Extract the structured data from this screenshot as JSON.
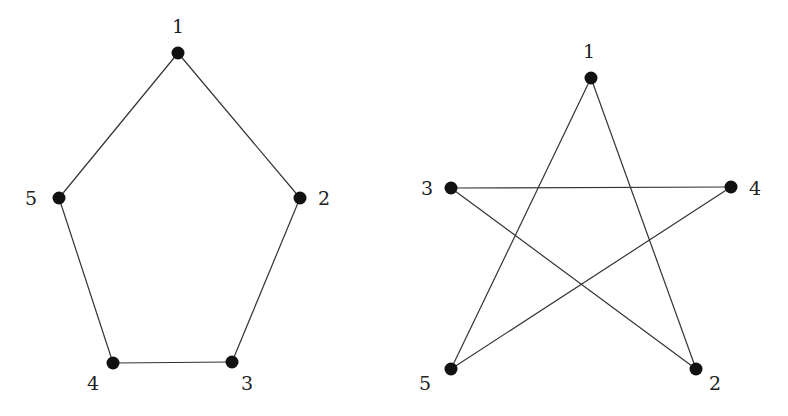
{
  "graphs": [
    {
      "name": "pentagon-cycle",
      "nodes": [
        {
          "id": "1",
          "label": "1",
          "x": 178,
          "y": 53,
          "lx": 178,
          "ly": 33,
          "anchor": "middle"
        },
        {
          "id": "2",
          "label": "2",
          "x": 300,
          "y": 198,
          "lx": 318,
          "ly": 205,
          "anchor": "start"
        },
        {
          "id": "3",
          "label": "3",
          "x": 232,
          "y": 362,
          "lx": 247,
          "ly": 390,
          "anchor": "middle"
        },
        {
          "id": "4",
          "label": "4",
          "x": 113,
          "y": 363,
          "lx": 93,
          "ly": 390,
          "anchor": "middle"
        },
        {
          "id": "5",
          "label": "5",
          "x": 59,
          "y": 198,
          "lx": 37,
          "ly": 205,
          "anchor": "end"
        }
      ],
      "edges": [
        [
          "1",
          "2"
        ],
        [
          "2",
          "3"
        ],
        [
          "3",
          "4"
        ],
        [
          "4",
          "5"
        ],
        [
          "5",
          "1"
        ]
      ]
    },
    {
      "name": "pentagram-cycle",
      "nodes": [
        {
          "id": "1",
          "label": "1",
          "x": 591,
          "y": 78,
          "lx": 589,
          "ly": 58,
          "anchor": "middle"
        },
        {
          "id": "2",
          "label": "2",
          "x": 696,
          "y": 369,
          "lx": 715,
          "ly": 390,
          "anchor": "middle"
        },
        {
          "id": "3",
          "label": "3",
          "x": 451,
          "y": 188,
          "lx": 433,
          "ly": 195,
          "anchor": "end"
        },
        {
          "id": "4",
          "label": "4",
          "x": 731,
          "y": 187,
          "lx": 749,
          "ly": 195,
          "anchor": "start"
        },
        {
          "id": "5",
          "label": "5",
          "x": 451,
          "y": 369,
          "lx": 425,
          "ly": 390,
          "anchor": "middle"
        }
      ],
      "edges": [
        [
          "1",
          "2"
        ],
        [
          "2",
          "3"
        ],
        [
          "3",
          "4"
        ],
        [
          "4",
          "5"
        ],
        [
          "5",
          "1"
        ]
      ]
    }
  ],
  "colors": {
    "node": "#111111",
    "edge": "#333333",
    "label": "#222222",
    "background": "#ffffff"
  }
}
